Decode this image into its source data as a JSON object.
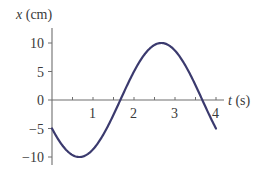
{
  "chart_data": {
    "type": "line",
    "title": "",
    "xlabel": "t (s)",
    "ylabel": "x (cm)",
    "xlabel_var": "t",
    "xlabel_unit": "(s)",
    "ylabel_var": "x",
    "ylabel_unit": "(cm)",
    "xlim": [
      0,
      4
    ],
    "ylim": [
      -10,
      10
    ],
    "x_ticks": [
      1,
      2,
      3,
      4
    ],
    "x_minor_step": 0.5,
    "y_ticks": [
      10,
      5,
      0,
      -5,
      -10
    ],
    "y_tick_labels": [
      "10",
      "5",
      "0",
      "−5",
      "−10"
    ],
    "grid": false,
    "legend": null,
    "series": [
      {
        "name": "x(t)",
        "color": "#3b3a6e",
        "x": [
          0,
          0.25,
          0.5,
          0.667,
          0.75,
          1.0,
          1.25,
          1.5,
          1.667,
          1.75,
          2.0,
          2.25,
          2.5,
          2.667,
          2.75,
          3.0,
          3.25,
          3.5,
          3.667,
          3.75,
          4.0
        ],
        "values": [
          -5.0,
          -7.9,
          -9.7,
          -10.0,
          -9.9,
          -8.7,
          -6.1,
          -2.6,
          0.0,
          1.3,
          5.0,
          7.9,
          9.7,
          10.0,
          9.9,
          8.7,
          6.1,
          2.6,
          0.0,
          -1.3,
          -5.0
        ]
      }
    ],
    "annotations": []
  },
  "axis": {
    "color": "#6e6e6e"
  }
}
